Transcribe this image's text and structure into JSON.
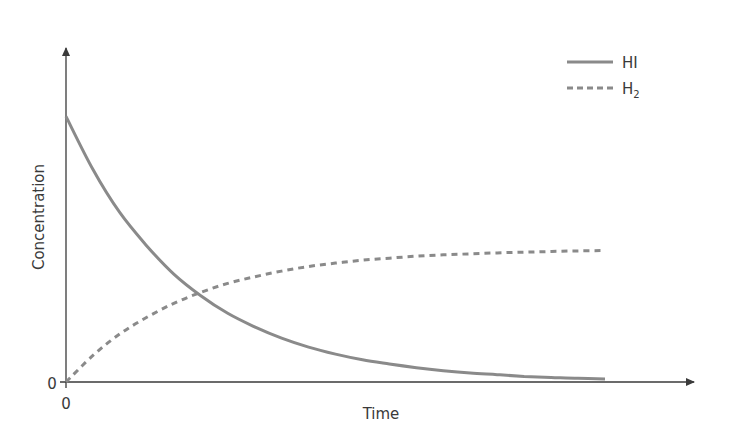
{
  "chart_data": {
    "type": "line",
    "title": "",
    "xlabel": "Time",
    "ylabel": "Concentration",
    "x_tick_labels": [
      "0"
    ],
    "y_tick_labels": [
      "0"
    ],
    "xlim": [
      0,
      1.1
    ],
    "ylim": [
      0,
      1
    ],
    "grid": false,
    "legend_position": "upper right",
    "x": [
      0,
      0.05,
      0.1,
      0.15,
      0.2,
      0.25,
      0.3,
      0.35,
      0.4,
      0.45,
      0.5,
      0.55,
      0.6,
      0.65,
      0.7,
      0.75,
      0.8,
      0.85,
      0.9,
      0.95,
      1.0
    ],
    "series": [
      {
        "name": "HI",
        "style": "solid",
        "color": "#8a8a8a",
        "values": [
          0.8,
          0.64,
          0.51,
          0.41,
          0.325,
          0.26,
          0.207,
          0.166,
          0.132,
          0.105,
          0.084,
          0.067,
          0.054,
          0.043,
          0.034,
          0.027,
          0.022,
          0.017,
          0.014,
          0.011,
          0.009
        ]
      },
      {
        "name": "H2",
        "style": "dashed",
        "color": "#8a8a8a",
        "values": [
          0.0,
          0.08,
          0.145,
          0.195,
          0.237,
          0.27,
          0.297,
          0.317,
          0.334,
          0.348,
          0.358,
          0.367,
          0.373,
          0.379,
          0.383,
          0.386,
          0.389,
          0.391,
          0.393,
          0.395,
          0.396
        ]
      }
    ]
  },
  "legend": {
    "items": [
      {
        "label": "HI",
        "style": "solid"
      },
      {
        "label": "H",
        "subscript": "2",
        "style": "dashed"
      }
    ]
  },
  "axes": {
    "x_label": "Time",
    "y_label": "Concentration",
    "x_origin_label": "0",
    "y_origin_label": "0"
  },
  "colors": {
    "axis": "#3a3a3a",
    "series": "#8a8a8a",
    "text": "#3a3a3a"
  }
}
